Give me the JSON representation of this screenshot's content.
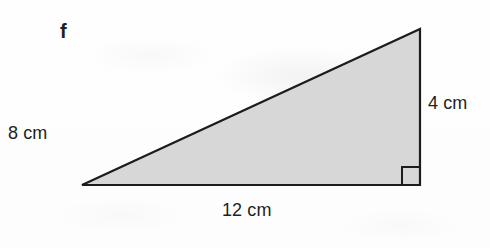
{
  "figure": {
    "part_label": "f",
    "shape": "right-triangle",
    "fill_color": "#d7d7d7",
    "stroke_color": "#1c1c1c",
    "background_color": "#fefefe",
    "vertices": {
      "left": [
        82,
        185
      ],
      "apex": [
        420,
        29
      ],
      "right_angle": [
        420,
        185
      ]
    },
    "right_angle_marker": {
      "shown": true,
      "at_vertex": "right_angle",
      "size_px": 18
    },
    "labels": {
      "left_side": "8 cm",
      "right_side": "4 cm",
      "base": "12 cm"
    },
    "measurements": [
      {
        "name": "left_side",
        "value": 8,
        "unit": "cm"
      },
      {
        "name": "right_side",
        "value": 4,
        "unit": "cm"
      },
      {
        "name": "base",
        "value": 12,
        "unit": "cm"
      }
    ]
  }
}
